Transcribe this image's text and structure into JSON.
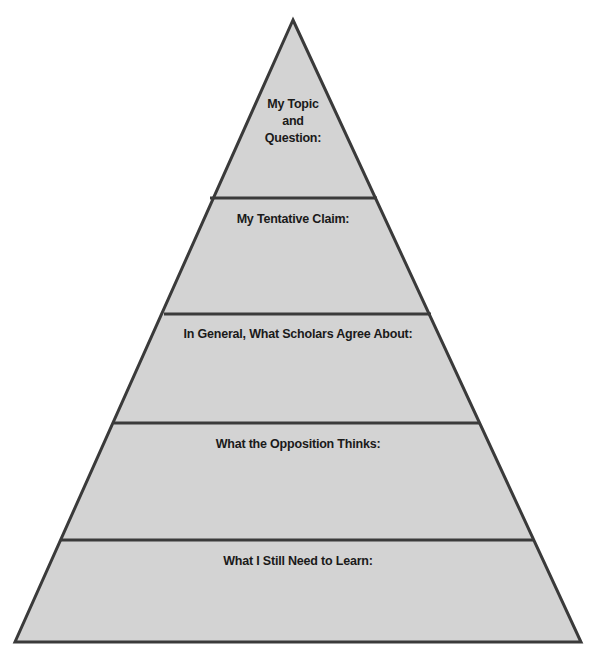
{
  "diagram": {
    "type": "pyramid",
    "colors": {
      "fill": "#d3d3d3",
      "stroke": "#3a3a3a",
      "text": "#1a1a1a",
      "background": "#ffffff"
    },
    "levels": [
      {
        "label": "My Topic\nand\nQuestion:"
      },
      {
        "label": "My Tentative Claim:"
      },
      {
        "label": "In General, What Scholars Agree About:"
      },
      {
        "label": "What the Opposition Thinks:"
      },
      {
        "label": "What I Still Need to Learn:"
      }
    ]
  }
}
